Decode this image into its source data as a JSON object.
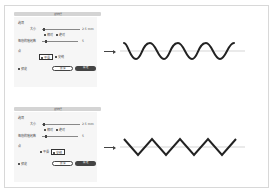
{
  "panels": [
    {
      "dialog": {
        "title": "波纹效果",
        "options_label": "选项",
        "size_label": "大小",
        "size_value": "2.5 mm",
        "relative_label": "相对",
        "absolute_label": "绝对",
        "mode_selected": "absolute",
        "ridges_label": "每段的隆起数",
        "ridges_value": "5",
        "points_label": "点",
        "smooth_label": "平滑",
        "corner_label": "尖锐",
        "points_selected": "smooth",
        "preview_label": "预览",
        "preview_checked": true,
        "cancel_label": "取消",
        "ok_label": "确定"
      },
      "result": "smooth-wave"
    },
    {
      "dialog": {
        "title": "波纹效果",
        "options_label": "选项",
        "size_label": "大小",
        "size_value": "2.5 mm",
        "relative_label": "相对",
        "absolute_label": "绝对",
        "mode_selected": "absolute",
        "ridges_label": "每段的隆起数",
        "ridges_value": "5",
        "points_label": "点",
        "smooth_label": "平滑",
        "corner_label": "尖锐",
        "points_selected": "corner",
        "preview_label": "预览",
        "preview_checked": true,
        "cancel_label": "取消",
        "ok_label": "确定"
      },
      "result": "zigzag-wave"
    }
  ],
  "icons": {
    "arrow": "arrow-right-icon"
  },
  "colors": {
    "stroke": "#222222",
    "guide": "#bbbbbb",
    "button_dark": "#444444"
  }
}
